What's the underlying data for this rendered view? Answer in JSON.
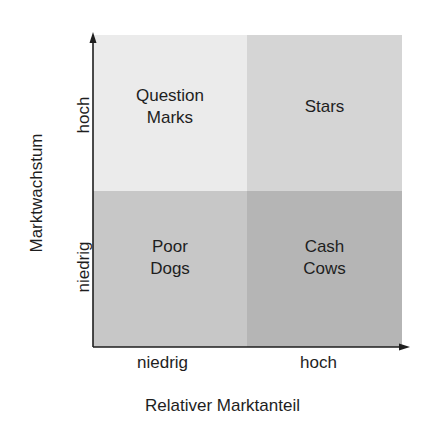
{
  "diagram": {
    "quadrants": [
      {
        "id": "top-left",
        "label": "Question\nMarks",
        "color": "#ebebeb"
      },
      {
        "id": "top-right",
        "label": "Stars",
        "color": "#d5d5d5"
      },
      {
        "id": "bottom-left",
        "label": "Poor\nDogs",
        "color": "#c7c7c7"
      },
      {
        "id": "bottom-right",
        "label": "Cash\nCows",
        "color": "#b5b5b5"
      }
    ],
    "x_axis": {
      "title": "Relativer Marktanteil",
      "ticks": [
        "niedrig",
        "hoch"
      ]
    },
    "y_axis": {
      "title": "Marktwachstum",
      "ticks": [
        "niedrig",
        "hoch"
      ]
    },
    "axis_color": "#1e1e1e"
  }
}
